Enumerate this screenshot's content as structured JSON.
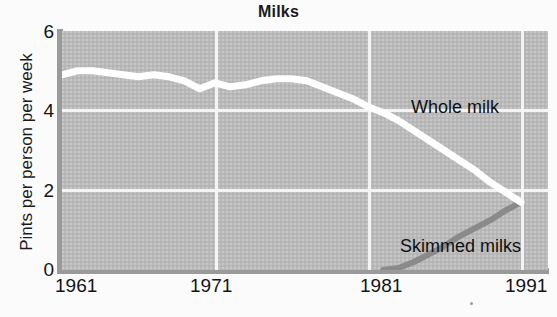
{
  "chart_data": {
    "type": "line",
    "title": "Milks",
    "xlabel": "",
    "ylabel": "Pints per person per week",
    "xlim": [
      1961,
      1991
    ],
    "ylim": [
      0,
      6
    ],
    "xticks": [
      "1961",
      "1971",
      "1981",
      "1991"
    ],
    "yticks": [
      "0",
      "2",
      "4",
      "6"
    ],
    "grid": true,
    "legend_position": "inline-annotations",
    "colors": {
      "panel": "#b9b9b9",
      "grid": "#f4f4f4",
      "axis": "#9a9a9a",
      "whole_milk": "#ffffff",
      "skimmed_milks": "#8a8a8a",
      "text": "#141414"
    },
    "annotations": [
      {
        "text": "Whole milk",
        "x": 1983.5,
        "y": 4.8
      },
      {
        "text": "Skimmed milks",
        "x": 1982.8,
        "y": 1.55
      }
    ],
    "series": [
      {
        "name": "Whole milk",
        "color": "#ffffff",
        "x": [
          1961,
          1962,
          1963,
          1964,
          1965,
          1966,
          1967,
          1968,
          1969,
          1970,
          1971,
          1972,
          1973,
          1974,
          1975,
          1976,
          1977,
          1978,
          1979,
          1980,
          1981,
          1982,
          1983,
          1984,
          1985,
          1986,
          1987,
          1988,
          1989,
          1990,
          1991
        ],
        "values": [
          4.9,
          5.0,
          5.0,
          4.95,
          4.9,
          4.85,
          4.9,
          4.85,
          4.75,
          4.55,
          4.7,
          4.6,
          4.65,
          4.75,
          4.8,
          4.8,
          4.75,
          4.6,
          4.45,
          4.3,
          4.1,
          3.95,
          3.75,
          3.5,
          3.25,
          3.0,
          2.75,
          2.5,
          2.2,
          1.95,
          1.7
        ]
      },
      {
        "name": "Skimmed milks",
        "color": "#8a8a8a",
        "x": [
          1961,
          1962,
          1963,
          1964,
          1965,
          1966,
          1967,
          1968,
          1969,
          1970,
          1971,
          1972,
          1973,
          1974,
          1975,
          1976,
          1977,
          1978,
          1979,
          1980,
          1981,
          1982,
          1983,
          1984,
          1985,
          1986,
          1987,
          1988,
          1989,
          1990,
          1991
        ],
        "values": [
          0,
          0,
          0,
          0,
          0,
          0,
          0,
          0,
          0,
          0,
          0,
          0,
          0,
          0,
          0,
          0,
          0,
          0,
          0,
          0,
          0,
          0,
          0.05,
          0.2,
          0.4,
          0.6,
          0.85,
          1.05,
          1.25,
          1.5,
          1.7
        ]
      }
    ]
  }
}
